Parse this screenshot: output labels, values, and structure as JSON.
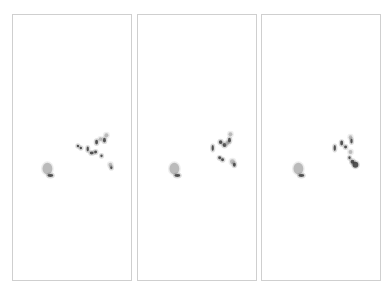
{
  "figure": {
    "panel_count": 3,
    "border_color": "#cfcfcf",
    "background": "#ffffff",
    "blob_color_dark": "#3a3a3a",
    "blob_color_light": "#9a9a9a",
    "panels": [
      {
        "id": "frame-1",
        "left": 12,
        "blobs": [
          {
            "x": 35,
            "y": 169,
            "rx": 5,
            "ry": 6,
            "shade": "light"
          },
          {
            "x": 38,
            "y": 176,
            "rx": 3,
            "ry": 1.5,
            "shade": "dark"
          },
          {
            "x": 66,
            "y": 146,
            "rx": 1.2,
            "ry": 1.2,
            "shade": "dark"
          },
          {
            "x": 69,
            "y": 148,
            "rx": 1.2,
            "ry": 1.2,
            "shade": "dark"
          },
          {
            "x": 76,
            "y": 149,
            "rx": 1.2,
            "ry": 2.5,
            "shade": "dark"
          },
          {
            "x": 80,
            "y": 153,
            "rx": 2,
            "ry": 1.5,
            "shade": "dark"
          },
          {
            "x": 84,
            "y": 152,
            "rx": 1.5,
            "ry": 1.5,
            "shade": "dark"
          },
          {
            "x": 85,
            "y": 142,
            "rx": 1.5,
            "ry": 2.5,
            "shade": "dark"
          },
          {
            "x": 89,
            "y": 139,
            "rx": 1.8,
            "ry": 1.8,
            "shade": "light"
          },
          {
            "x": 93,
            "y": 140,
            "rx": 1.5,
            "ry": 2.5,
            "shade": "dark"
          },
          {
            "x": 95,
            "y": 135,
            "rx": 2,
            "ry": 2,
            "shade": "light"
          },
          {
            "x": 90,
            "y": 156,
            "rx": 1.2,
            "ry": 1.5,
            "shade": "dark"
          },
          {
            "x": 99,
            "y": 165,
            "rx": 2,
            "ry": 2,
            "shade": "light"
          },
          {
            "x": 100,
            "y": 168,
            "rx": 1.2,
            "ry": 1.5,
            "shade": "dark"
          }
        ]
      },
      {
        "id": "frame-2",
        "left": 137,
        "blobs": [
          {
            "x": 37,
            "y": 169,
            "rx": 5,
            "ry": 6,
            "shade": "light"
          },
          {
            "x": 40,
            "y": 176,
            "rx": 3,
            "ry": 1.5,
            "shade": "dark"
          },
          {
            "x": 76,
            "y": 148,
            "rx": 1.2,
            "ry": 3,
            "shade": "dark"
          },
          {
            "x": 84,
            "y": 142,
            "rx": 1.8,
            "ry": 2,
            "shade": "dark"
          },
          {
            "x": 88,
            "y": 145,
            "rx": 2,
            "ry": 2,
            "shade": "dark"
          },
          {
            "x": 91,
            "y": 143,
            "rx": 2,
            "ry": 2,
            "shade": "light"
          },
          {
            "x": 93,
            "y": 140,
            "rx": 1.5,
            "ry": 2.5,
            "shade": "dark"
          },
          {
            "x": 94,
            "y": 134,
            "rx": 2,
            "ry": 2,
            "shade": "light"
          },
          {
            "x": 83,
            "y": 158,
            "rx": 1.5,
            "ry": 1.5,
            "shade": "dark"
          },
          {
            "x": 86,
            "y": 160,
            "rx": 1.5,
            "ry": 1.5,
            "shade": "dark"
          },
          {
            "x": 96,
            "y": 162,
            "rx": 2.5,
            "ry": 2.5,
            "shade": "light"
          },
          {
            "x": 98,
            "y": 165,
            "rx": 1.5,
            "ry": 2,
            "shade": "dark"
          }
        ]
      },
      {
        "id": "frame-3",
        "left": 261,
        "blobs": [
          {
            "x": 37,
            "y": 169,
            "rx": 5,
            "ry": 6,
            "shade": "light"
          },
          {
            "x": 40,
            "y": 176,
            "rx": 3,
            "ry": 1.5,
            "shade": "dark"
          },
          {
            "x": 74,
            "y": 148,
            "rx": 1.2,
            "ry": 3,
            "shade": "dark"
          },
          {
            "x": 81,
            "y": 143,
            "rx": 1.5,
            "ry": 2.5,
            "shade": "dark"
          },
          {
            "x": 85,
            "y": 147,
            "rx": 1.5,
            "ry": 1.5,
            "shade": "dark"
          },
          {
            "x": 90,
            "y": 137,
            "rx": 1.8,
            "ry": 2,
            "shade": "light"
          },
          {
            "x": 91,
            "y": 141,
            "rx": 1.2,
            "ry": 2.5,
            "shade": "dark"
          },
          {
            "x": 90,
            "y": 152,
            "rx": 2,
            "ry": 2,
            "shade": "light"
          },
          {
            "x": 89,
            "y": 158,
            "rx": 1.2,
            "ry": 1.5,
            "shade": "dark"
          },
          {
            "x": 92,
            "y": 162,
            "rx": 2,
            "ry": 2,
            "shade": "dark"
          },
          {
            "x": 95,
            "y": 165,
            "rx": 3,
            "ry": 3,
            "shade": "dark"
          }
        ]
      }
    ]
  }
}
